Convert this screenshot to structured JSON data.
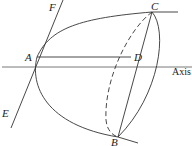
{
  "diagram": {
    "points": {
      "A": {
        "label": "A",
        "x": 37,
        "y": 57
      },
      "B": {
        "label": "B",
        "x": 118,
        "y": 137
      },
      "C": {
        "label": "C",
        "x": 152,
        "y": 12
      },
      "D": {
        "label": "D",
        "x": 131,
        "y": 57
      },
      "E": {
        "label": "E"
      },
      "F": {
        "label": "F"
      }
    },
    "axis_label": "Axis",
    "colors": {
      "stroke": "#333333",
      "background": "#ffffff"
    }
  }
}
